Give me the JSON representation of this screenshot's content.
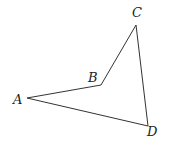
{
  "diagram": {
    "type": "quadrilateral",
    "vertices": [
      {
        "name": "A",
        "x": 27,
        "y": 98,
        "label_x": 13,
        "label_y": 104
      },
      {
        "name": "B",
        "x": 101,
        "y": 85,
        "label_x": 88,
        "label_y": 82
      },
      {
        "name": "C",
        "x": 136,
        "y": 25,
        "label_x": 132,
        "label_y": 17
      },
      {
        "name": "D",
        "x": 148,
        "y": 126,
        "label_x": 147,
        "label_y": 136
      }
    ],
    "edges": [
      {
        "from": "A",
        "to": "B"
      },
      {
        "from": "B",
        "to": "C"
      },
      {
        "from": "C",
        "to": "D"
      },
      {
        "from": "D",
        "to": "A"
      }
    ],
    "colors": {
      "line": "#333333",
      "text": "#222222",
      "background": "#ffffff"
    }
  },
  "labels": {
    "A": "A",
    "B": "B",
    "C": "C",
    "D": "D"
  }
}
